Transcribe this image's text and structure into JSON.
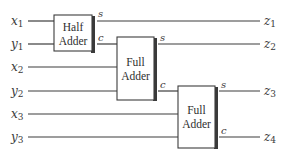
{
  "diagram": {
    "title": "",
    "inputs": [
      {
        "var": "x",
        "sub": "1"
      },
      {
        "var": "y",
        "sub": "1"
      },
      {
        "var": "x",
        "sub": "2"
      },
      {
        "var": "y",
        "sub": "2"
      },
      {
        "var": "x",
        "sub": "3"
      },
      {
        "var": "y",
        "sub": "3"
      }
    ],
    "outputs": [
      {
        "var": "z",
        "sub": "1"
      },
      {
        "var": "z",
        "sub": "2"
      },
      {
        "var": "z",
        "sub": "3"
      },
      {
        "var": "z",
        "sub": "4"
      }
    ],
    "blocks": [
      {
        "line1": "Half",
        "line2": "Adder",
        "sum_label": "s",
        "carry_label": "c"
      },
      {
        "line1": "Full",
        "line2": "Adder",
        "sum_label": "s",
        "carry_label": "c"
      },
      {
        "line1": "Full",
        "line2": "Adder",
        "sum_label": "s",
        "carry_label": "c"
      }
    ],
    "colors": {
      "line": "#3c3c3c",
      "text": "#3a3a3a",
      "background": "#ffffff"
    }
  }
}
